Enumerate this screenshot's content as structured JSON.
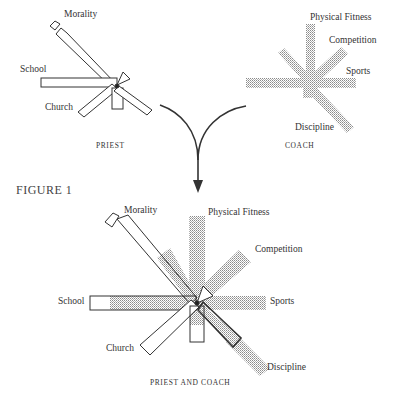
{
  "figure_label": "FIGURE 1",
  "priest": {
    "caption": "PRIEST",
    "labels": {
      "morality": "Morality",
      "school": "School",
      "church": "Church"
    }
  },
  "coach": {
    "caption": "COACH",
    "labels": {
      "physical_fitness": "Physical Fitness",
      "competition": "Competition",
      "sports": "Sports",
      "discipline": "Discipline"
    }
  },
  "combined": {
    "caption": "PRIEST AND COACH",
    "labels": {
      "morality": "Morality",
      "school": "School",
      "church": "Church",
      "physical_fitness": "Physical Fitness",
      "competition": "Competition",
      "sports": "Sports",
      "discipline": "Discipline"
    }
  },
  "colors": {
    "outline": "#333333",
    "stipple": "#9a9a9a"
  }
}
